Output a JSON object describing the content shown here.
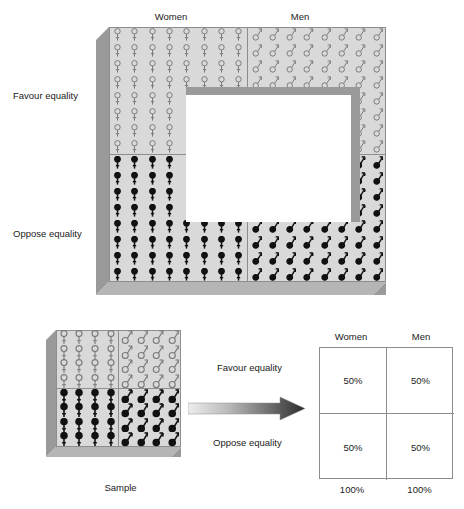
{
  "figure": {
    "population_diagram": {
      "column_headers": [
        "Women",
        "Men"
      ],
      "row_labels": [
        "Favour equality",
        "Oppose equality"
      ],
      "grid": {
        "columns": 16,
        "rows": 16,
        "columns_per_group": 8,
        "rows_per_group": 8
      },
      "cutout": {
        "col_start": 5,
        "col_end": 12,
        "row_start": 5,
        "row_end": 12
      },
      "glyphs": {
        "women_favour": "female-outline-icon",
        "men_favour": "male-outline-icon",
        "women_oppose": "female-filled-icon",
        "men_oppose": "male-filled-icon"
      }
    },
    "sample_diagram": {
      "caption": "Sample",
      "grid": {
        "columns": 8,
        "rows": 8,
        "columns_per_group": 4,
        "rows_per_group": 4
      },
      "glyphs": {
        "women_favour": "female-outline-icon",
        "men_favour": "male-outline-icon",
        "women_oppose": "female-filled-icon",
        "men_oppose": "male-filled-icon"
      }
    },
    "arrow": {
      "name": "inference-arrow",
      "direction": "right"
    },
    "results_table": {
      "column_headers": [
        "Women",
        "Men"
      ],
      "row_labels": [
        "Favour equality",
        "Oppose equality"
      ],
      "cells": [
        [
          "50%",
          "50%"
        ],
        [
          "50%",
          "50%"
        ]
      ],
      "totals": [
        "100%",
        "100%"
      ]
    },
    "colors": {
      "box_face": "#d9d9d9",
      "box_side": "#9a9a9a",
      "grid_line": "#8d8d8d",
      "glyph_outline": "#7a7a7a",
      "glyph_filled": "#111111",
      "table_border": "#8d8d8d",
      "text": "#1a1a1a"
    }
  },
  "chart_data": {
    "type": "table",
    "categories": [
      "Women",
      "Men"
    ],
    "row_categories": [
      "Favour equality",
      "Oppose equality"
    ],
    "series": [
      {
        "name": "Favour equality",
        "values": [
          50,
          50
        ]
      },
      {
        "name": "Oppose equality",
        "values": [
          50,
          50
        ]
      }
    ],
    "column_totals": [
      100,
      100
    ],
    "units": "percent",
    "xlabel": "",
    "ylabel": "",
    "legend": [
      "Women",
      "Men"
    ],
    "annotations": [
      "Sample"
    ],
    "grid": true
  }
}
